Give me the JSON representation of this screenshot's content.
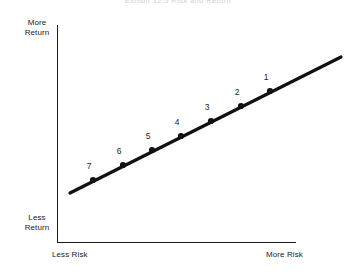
{
  "title": "Exhibit 12.5   Risk and Return",
  "axes": {
    "y_top_label": "More\nReturn",
    "y_bottom_label": "Less\nReturn",
    "x_left_label": "Less Risk",
    "x_right_label": "More Risk"
  },
  "chart_data": {
    "type": "line",
    "title": "Exhibit 12.5   Risk and Return",
    "xlabel": "Risk",
    "ylabel": "Return",
    "grid": false,
    "legend": null,
    "axis_tick_labels": {
      "x": [
        "Less Risk",
        "More Risk"
      ],
      "y": [
        "Less Return",
        "More Return"
      ]
    },
    "series": [
      {
        "name": "Risk-return tradeoff line",
        "color": "#111111",
        "points": [
          {
            "label": "7",
            "x": 1,
            "y": 1,
            "px": 93,
            "py": 180,
            "label_px": 89,
            "label_py": 166
          },
          {
            "label": "6",
            "x": 2,
            "y": 2,
            "px": 123,
            "py": 165,
            "label_px": 119,
            "label_py": 151
          },
          {
            "label": "5",
            "x": 3,
            "y": 3,
            "px": 152,
            "py": 150,
            "label_px": 148,
            "label_py": 136
          },
          {
            "label": "4",
            "x": 4,
            "y": 4,
            "px": 181,
            "py": 136,
            "label_px": 177,
            "label_py": 122
          },
          {
            "label": "3",
            "x": 5,
            "y": 5,
            "px": 211,
            "py": 121,
            "label_px": 207,
            "label_py": 107
          },
          {
            "label": "2",
            "x": 6,
            "y": 6,
            "px": 241,
            "py": 106,
            "label_px": 237,
            "label_py": 92
          },
          {
            "label": "1",
            "x": 7,
            "y": 7,
            "px": 270,
            "py": 91,
            "label_px": 266,
            "label_py": 77
          }
        ]
      }
    ],
    "line_extent": {
      "x1": 70,
      "y1": 193,
      "x2": 341,
      "y2": 57
    },
    "xlim": [
      0,
      8
    ],
    "ylim": [
      0,
      8
    ]
  },
  "colors": {
    "line": "#111111",
    "axis": "#1b1b1b",
    "text": "#1b1b1b",
    "title": "#c9c9cf",
    "background": "#ffffff"
  }
}
